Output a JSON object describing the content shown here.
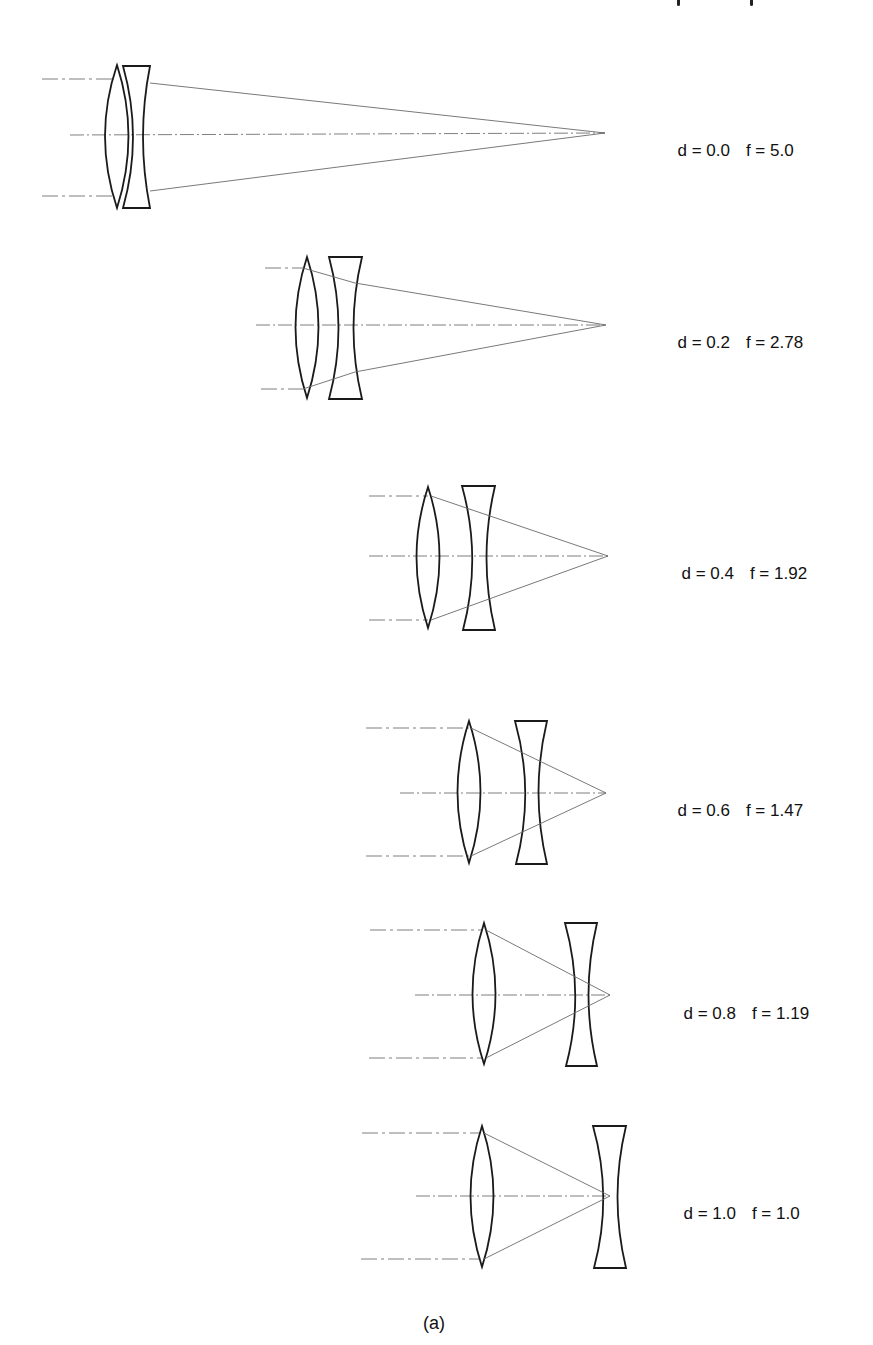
{
  "figure": {
    "caption": "(a)",
    "panels": [
      {
        "d_label": "d = 0.0",
        "f_label": "f = 5.0",
        "d": 0.0,
        "f": 5.0
      },
      {
        "d_label": "d = 0.2",
        "f_label": "f = 2.78",
        "d": 0.2,
        "f": 2.78
      },
      {
        "d_label": "d = 0.4",
        "f_label": "f = 1.92",
        "d": 0.4,
        "f": 1.92
      },
      {
        "d_label": "d = 0.6",
        "f_label": "f = 1.47",
        "d": 0.6,
        "f": 1.47
      },
      {
        "d_label": "d = 0.8",
        "f_label": "f = 1.19",
        "d": 0.8,
        "f": 1.19
      },
      {
        "d_label": "d = 1.0",
        "f_label": "f = 1.0",
        "d": 1.0,
        "f": 1.0
      }
    ]
  },
  "colors": {
    "lens_stroke": "#1a1a1a",
    "ray_stroke": "#6a6a6a",
    "background": "#ffffff"
  }
}
